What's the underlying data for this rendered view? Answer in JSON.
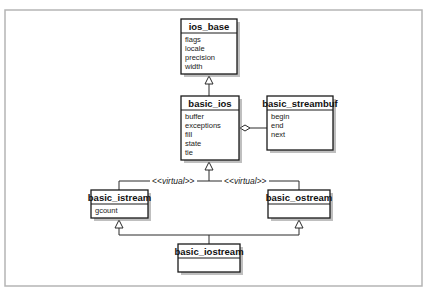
{
  "diagram": {
    "type": "uml-class-diagram",
    "colors": {
      "frame": "#b5b5b5",
      "box_stroke": "#1a1a1a",
      "shadow": "#8a8a8a",
      "background": "#ffffff"
    },
    "classes": {
      "ios_base": {
        "name": "ios_base",
        "attributes": [
          "flags",
          "locale",
          "precision",
          "width"
        ]
      },
      "basic_ios": {
        "name": "basic_ios",
        "attributes": [
          "buffer",
          "exceptions",
          "fill",
          "state",
          "tie"
        ]
      },
      "basic_streambuf": {
        "name": "basic_streambuf",
        "attributes": [
          "begin",
          "end",
          "next"
        ]
      },
      "basic_istream": {
        "name": "basic_istream",
        "attributes": [
          "gcount"
        ]
      },
      "basic_ostream": {
        "name": "basic_ostream",
        "attributes": []
      },
      "basic_iostream": {
        "name": "basic_iostream",
        "attributes": []
      }
    },
    "relationships": [
      {
        "from": "basic_ios",
        "to": "ios_base",
        "type": "inheritance"
      },
      {
        "from": "basic_ios",
        "to": "basic_streambuf",
        "type": "aggregation"
      },
      {
        "from": "basic_istream",
        "to": "basic_ios",
        "type": "inheritance",
        "stereotype": "virtual"
      },
      {
        "from": "basic_ostream",
        "to": "basic_ios",
        "type": "inheritance",
        "stereotype": "virtual"
      },
      {
        "from": "basic_iostream",
        "to": "basic_istream",
        "type": "inheritance"
      },
      {
        "from": "basic_iostream",
        "to": "basic_ostream",
        "type": "inheritance"
      }
    ],
    "stereotype_labels": {
      "left": {
        "open": "<<",
        "text": "virtual",
        "close": ">>"
      },
      "right": {
        "open": "<<",
        "text": "virtual",
        "close": ">>"
      }
    }
  }
}
